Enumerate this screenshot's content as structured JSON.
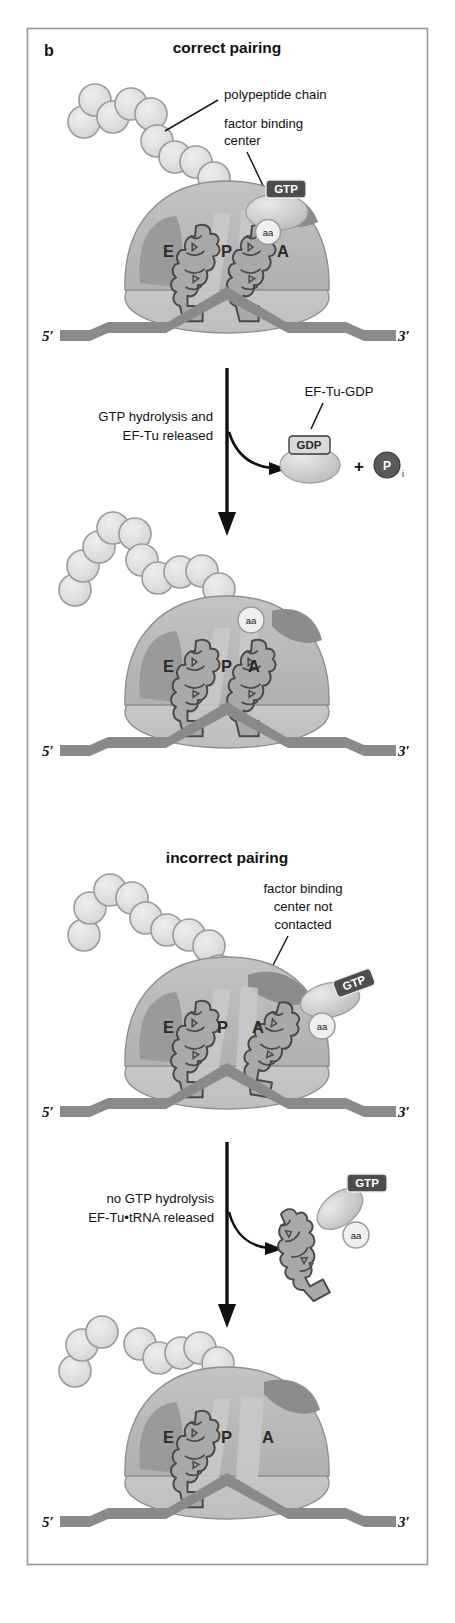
{
  "figure": {
    "panel_letter": "b",
    "frame": {
      "x": 27,
      "y": 28,
      "width": 401,
      "height": 1537,
      "border_color": "#9a9a9a"
    }
  },
  "headings": {
    "correct": "correct pairing",
    "incorrect": "incorrect pairing"
  },
  "callouts": {
    "polypeptide_chain": "polypeptide chain",
    "factor_binding_center_l1": "factor binding",
    "factor_binding_center_l2": "center",
    "fbc_not_contacted_l1": "factor binding",
    "fbc_not_contacted_l2": "center not",
    "fbc_not_contacted_l3": "contacted"
  },
  "steps": {
    "step1_l1": "GTP hydrolysis and",
    "step1_l2": "EF-Tu released",
    "step2_l1": "no GTP hydrolysis",
    "step2_l2": "EF-Tu•tRNA released",
    "ef_tu_gdp_label": "EF-Tu-GDP",
    "plus": "+"
  },
  "badges": {
    "gtp": "GTP",
    "gdp": "GDP",
    "pi_letter": "P",
    "pi_subscript": "i",
    "aa": "aa"
  },
  "ribosome_sites": {
    "e": "E",
    "p": "P",
    "a": "A"
  },
  "mrna_ends": {
    "five_prime": "5′",
    "three_prime": "3′"
  },
  "panels": [
    {
      "id": "panel-1-correct-initial",
      "heading": "correct pairing",
      "description": "Ribosome with E, P, A sites; tRNA in P and A sites; EF-Tu-GTP contacting factor binding center; aa attached",
      "sites": [
        "E",
        "P",
        "A"
      ],
      "has_gtp": true,
      "has_aa": true,
      "polypeptide_beads": 9
    },
    {
      "id": "panel-2-correct-accommodated",
      "heading": "",
      "description": "Ribosome after GTP hydrolysis; EF-Tu released; tRNA accommodated in A site with aa",
      "sites": [
        "E",
        "P",
        "A"
      ],
      "has_gtp": false,
      "has_aa": true,
      "polypeptide_beads": 10
    },
    {
      "id": "panel-3-incorrect-initial",
      "heading": "incorrect pairing",
      "description": "Ribosome with incorrectly paired tRNA; EF-Tu-GTP not contacting factor binding center",
      "sites": [
        "E",
        "P",
        "A"
      ],
      "has_gtp": true,
      "has_aa": true,
      "polypeptide_beads": 9
    },
    {
      "id": "panel-4-incorrect-rejected",
      "heading": "",
      "description": "Ribosome after rejection; A site empty; only P-site tRNA remains",
      "sites": [
        "E",
        "P",
        "A"
      ],
      "has_gtp": false,
      "has_aa": false,
      "polypeptide_beads": 9
    }
  ],
  "colors": {
    "background": "#ffffff",
    "frame_border": "#9a9a9a",
    "large_subunit": "#b9b9b9",
    "large_subunit_light": "#c8c8c8",
    "small_subunit": "#c4c4c4",
    "dark_region": "#8d8d8d",
    "mrna": "#8a8a8a",
    "trna_outline": "#4a4a4a",
    "trna_fill": "#a8a8a8",
    "bead_fill": "#dcdcdc",
    "bead_stroke": "#9b9b9b",
    "ef_tu_fill": "#d2d2d2",
    "badge_dark": "#4d4d4d",
    "text": "#111111"
  }
}
